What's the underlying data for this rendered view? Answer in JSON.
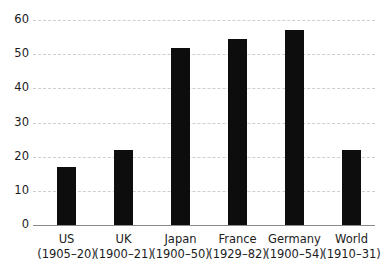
{
  "chart_data": {
    "type": "bar",
    "title": "",
    "subtitle": "",
    "xlabel": "",
    "ylabel": "",
    "ylim": [
      0,
      60
    ],
    "yticks": [
      0,
      10,
      20,
      30,
      40,
      50,
      60
    ],
    "ytick_labels": [
      "0",
      "10",
      "20",
      "30",
      "40",
      "50",
      "60"
    ],
    "grid": true,
    "legend": false,
    "legend_position": "none",
    "bar_color": "#0d0d0d",
    "gridline_color": "#cfcfcf",
    "axis_color": "#8a8a8a",
    "text_color": "#1c1c1c",
    "categories": [
      "US",
      "UK",
      "Japan",
      "France",
      "Germany",
      "World"
    ],
    "category_periods": [
      "(1905–20)",
      "(1900–21)",
      "(1900–50)",
      "(1929–82)",
      "(1900–54)",
      "(1910–31)"
    ],
    "tick_labels": [
      "US (1905–20)",
      "UK (1900–21)",
      "Japan (1900–50)",
      "France (1929–82)",
      "Germany (1900–54)",
      "World (1910–31)"
    ],
    "values": [
      17,
      22,
      51.8,
      54.5,
      57,
      22
    ]
  }
}
